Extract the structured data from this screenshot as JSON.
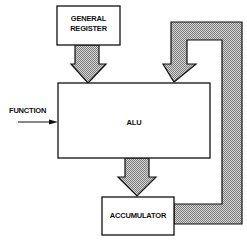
{
  "diagram": {
    "title": "",
    "nodes": {
      "general_register": {
        "label_line1": "GENERAL",
        "label_line2": "REGISTER"
      },
      "alu": {
        "label": "ALU"
      },
      "accumulator": {
        "label": "ACCUMULATOR"
      }
    },
    "inputs": {
      "function": {
        "label": "FUNCTION"
      }
    },
    "edges": [
      {
        "from": "general_register",
        "to": "alu",
        "style": "hatched-wide-arrow"
      },
      {
        "from": "accumulator",
        "to": "alu",
        "style": "hatched-wide-feedback-arrow"
      },
      {
        "from": "alu",
        "to": "accumulator",
        "style": "hatched-wide-arrow"
      },
      {
        "from": "function",
        "to": "alu",
        "style": "thin-arrow"
      }
    ],
    "colors": {
      "stroke": "#111111",
      "fill": "#ffffff",
      "hatch": "#9a9a9a"
    }
  }
}
